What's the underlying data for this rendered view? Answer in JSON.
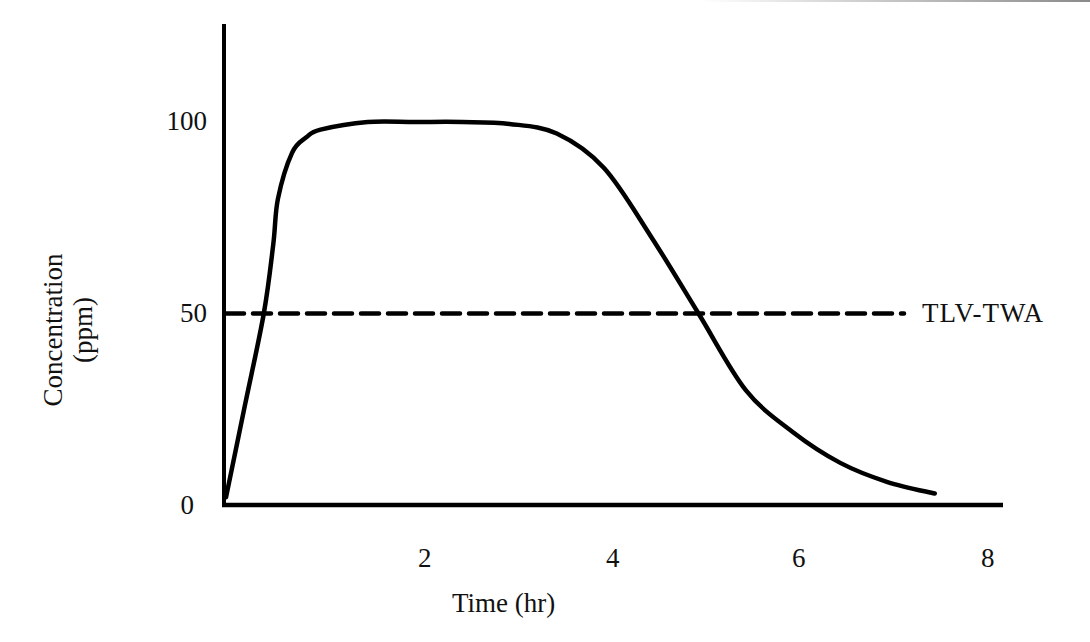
{
  "chart_data": {
    "type": "line",
    "title": "",
    "xlabel": "Time (hr)",
    "ylabel": "Concentration (ppm)",
    "ylabel_lines": [
      "Concentration",
      "(ppm)"
    ],
    "xlim": [
      0,
      8
    ],
    "ylim": [
      0,
      120
    ],
    "x_ticks": [
      2,
      4,
      6,
      8
    ],
    "x_tick_labels": [
      "2",
      "4",
      "6",
      "8"
    ],
    "y_ticks": [
      0,
      50,
      100
    ],
    "y_tick_labels": [
      "0",
      "50",
      "100"
    ],
    "grid": false,
    "series": [
      {
        "name": "Exposure concentration",
        "style": "solid",
        "color": "#000000",
        "x": [
          0,
          0.2,
          0.4,
          0.5,
          0.55,
          0.7,
          0.85,
          1.0,
          1.5,
          2.0,
          2.5,
          3.0,
          3.5,
          4.0,
          4.5,
          5.0,
          5.5,
          6.0,
          6.5,
          7.0,
          7.5
        ],
        "values": [
          2,
          26,
          50,
          68,
          80,
          92,
          96,
          98,
          100,
          100,
          100,
          99.5,
          97,
          88,
          70,
          50,
          30,
          19,
          11,
          6,
          3
        ]
      },
      {
        "name": "TLV-TWA",
        "style": "dashed",
        "color": "#000000",
        "x": [
          0,
          7.5
        ],
        "values": [
          50,
          50
        ]
      }
    ],
    "annotations": [
      {
        "text": "TLV-TWA",
        "x": 7.6,
        "y": 50
      }
    ],
    "legend_position": "inline-right"
  },
  "labels": {
    "ylabel_line1": "Concentration",
    "ylabel_line2": "(ppm)",
    "xlabel": "Time (hr)",
    "ytick_100": "100",
    "ytick_50": "50",
    "ytick_0": "0",
    "xtick_2": "2",
    "xtick_4": "4",
    "xtick_6": "6",
    "xtick_8": "8",
    "tlv_label": "TLV-TWA"
  },
  "colors": {
    "line": "#000000",
    "background": "#ffffff"
  }
}
